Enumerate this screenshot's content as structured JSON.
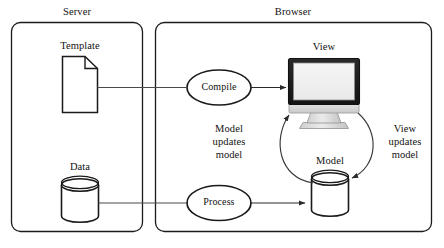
{
  "diagram": {
    "type": "architecture-flow-diagram",
    "containers": [
      {
        "id": "server",
        "label": "Server"
      },
      {
        "id": "browser",
        "label": "Browser"
      }
    ],
    "nodes": [
      {
        "id": "template",
        "label": "Template",
        "icon": "document-icon"
      },
      {
        "id": "data",
        "label": "Data",
        "icon": "database-cylinder-icon"
      },
      {
        "id": "view",
        "label": "View",
        "icon": "desktop-monitor-icon"
      },
      {
        "id": "model",
        "label": "Model",
        "icon": "database-cylinder-icon"
      }
    ],
    "processes": [
      {
        "id": "compile",
        "label": "Compile",
        "shape": "ellipse"
      },
      {
        "id": "process",
        "label": "Process",
        "shape": "ellipse"
      }
    ],
    "edges": [
      {
        "id": "template-compile",
        "label": "",
        "from": "template",
        "to": "compile",
        "arrow": false
      },
      {
        "id": "compile-view",
        "label": "",
        "from": "compile",
        "to": "view",
        "arrow": true
      },
      {
        "id": "data-process",
        "label": "",
        "from": "data",
        "to": "process",
        "arrow": false
      },
      {
        "id": "process-model",
        "label": "",
        "from": "process",
        "to": "model",
        "arrow": true
      },
      {
        "id": "model-updates-view",
        "label": "Model\nupdates\nmodel",
        "from": "model",
        "to": "view",
        "arrow": true,
        "curve": "left"
      },
      {
        "id": "view-updates-model",
        "label": "View\nupdates\nmodel",
        "from": "view",
        "to": "model",
        "arrow": true,
        "curve": "right"
      }
    ],
    "colors": {
      "stroke": "#1a1a1a",
      "edge_stroke": "#3a3a3a",
      "background": "#ffffff",
      "screen_fill": "#f2f2f2",
      "bezel_fill": "#1c1c1c",
      "stand_fill": "#d8d8d8"
    }
  }
}
